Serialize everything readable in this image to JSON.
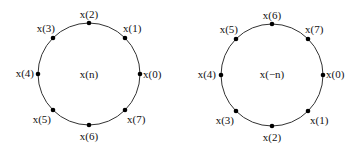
{
  "diagrams": [
    {
      "center_label": "x(n)",
      "points": [
        {
          "label": "x(0)",
          "angle_deg": 0
        },
        {
          "label": "x(1)",
          "angle_deg": 45
        },
        {
          "label": "x(2)",
          "angle_deg": 90
        },
        {
          "label": "x(3)",
          "angle_deg": 135
        },
        {
          "label": "x(4)",
          "angle_deg": 180
        },
        {
          "label": "x(5)",
          "angle_deg": 225
        },
        {
          "label": "x(6)",
          "angle_deg": 270
        },
        {
          "label": "x(7)",
          "angle_deg": 315
        }
      ]
    },
    {
      "center_label": "x(−n)",
      "points": [
        {
          "label": "x(0)",
          "angle_deg": 0
        },
        {
          "label": "x(7)",
          "angle_deg": 45
        },
        {
          "label": "x(6)",
          "angle_deg": 90
        },
        {
          "label": "x(5)",
          "angle_deg": 135
        },
        {
          "label": "x(4)",
          "angle_deg": 180
        },
        {
          "label": "x(3)",
          "angle_deg": 225
        },
        {
          "label": "x(2)",
          "angle_deg": 270
        },
        {
          "label": "x(1)",
          "angle_deg": 315
        }
      ]
    }
  ]
}
